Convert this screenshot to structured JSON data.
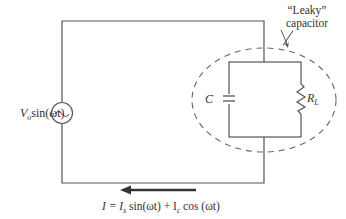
{
  "diagram": {
    "type": "circuit",
    "source": {
      "label_main": "V",
      "label_sub": "o",
      "label_rest": "sin(ωt)",
      "symbol": "~"
    },
    "annotation": {
      "line1": "“Leaky”",
      "line2": "capacitor"
    },
    "components": {
      "capacitor": {
        "label": "C"
      },
      "resistor": {
        "label_main": "R",
        "label_sub": "L"
      }
    },
    "current": {
      "label_prefix": "I = I",
      "sub_s": "s",
      "mid": " sin(ωt) + I",
      "sub_c": "c",
      "suffix": " cos (ωt)",
      "direction": "left"
    },
    "colors": {
      "wire": "#555555",
      "dashed": "#666666",
      "text": "#333333"
    }
  }
}
